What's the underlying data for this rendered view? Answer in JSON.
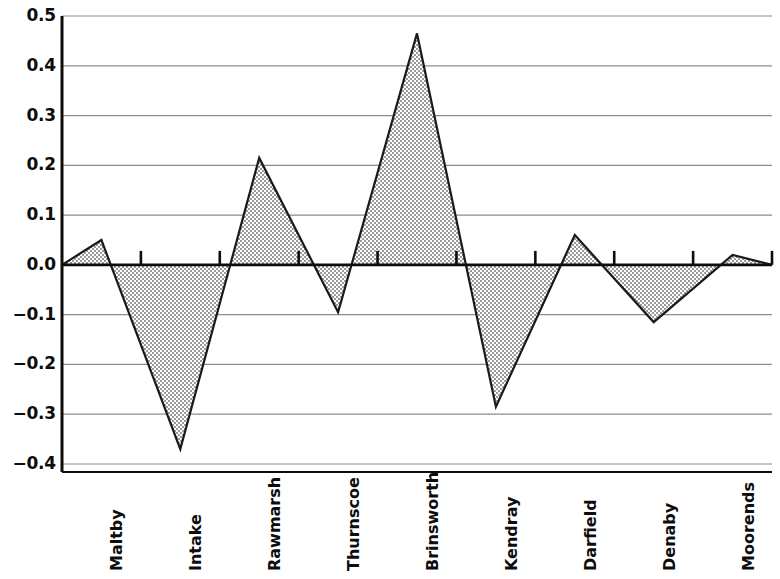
{
  "chart_data": {
    "type": "area",
    "title": "",
    "subtitle": "",
    "xlabel": "",
    "ylabel": "",
    "categories": [
      "Maltby",
      "Intake",
      "Rawmarsh",
      "Thurnscoe",
      "Brinsworth",
      "Kendray",
      "Darfield",
      "Denaby",
      "Moorends"
    ],
    "values": [
      0.05,
      -0.37,
      0.215,
      -0.095,
      0.465,
      -0.285,
      0.06,
      -0.115,
      0.02
    ],
    "series": [
      {
        "name": "",
        "values": [
          0.05,
          -0.37,
          0.215,
          -0.095,
          0.465,
          -0.285,
          0.06,
          -0.115,
          0.02
        ]
      }
    ],
    "ylim": [
      -0.4,
      0.5
    ],
    "ytick_labels": [
      "0.5",
      "0.4",
      "0.3",
      "0.2",
      "0.1",
      "0.0",
      "−0.1",
      "−0.2",
      "−0.3",
      "−0.4"
    ],
    "ytick_values": [
      0.5,
      0.4,
      0.3,
      0.2,
      0.1,
      0.0,
      -0.1,
      -0.2,
      -0.3,
      -0.4
    ],
    "grid": true,
    "grid_axis": "y",
    "legend": false,
    "legend_position": "none",
    "baseline_value": 0.0,
    "colors": {
      "fill": "#b4b4b4",
      "line": "#1a1a1a",
      "grid": "#8c8c8c",
      "axis": "#0d0d0d",
      "background": "#ffffff",
      "text": "#0d0d0d"
    }
  }
}
